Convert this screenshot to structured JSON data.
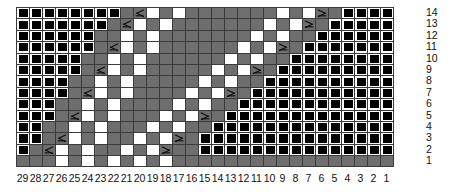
{
  "chart_title": "Lace Knitting Chart",
  "legend_keys": {
    "black_square": "no-stitch / cast-off",
    "gray_cell": "knit",
    "white_cell": "purl or yarn-over",
    "dec_left": "left-leaning decrease",
    "dec_right": "right-leaning decrease"
  },
  "colors": {
    "gray": "#6e6e6e",
    "white": "#ffffff",
    "black": "#000000",
    "gridline": "#3a3a3a",
    "heavy_gridline": "#111111",
    "text": "#111111"
  },
  "grid": {
    "columns": 29,
    "rows": 14,
    "cell_width_px": 13,
    "cell_height_px": 11.4
  },
  "row_numbers": [
    "14",
    "13",
    "12",
    "11",
    "10",
    "9",
    "8",
    "7",
    "6",
    "5",
    "4",
    "3",
    "2",
    "1"
  ],
  "column_numbers": [
    "29",
    "28",
    "27",
    "26",
    "25",
    "24",
    "23",
    "22",
    "21",
    "20",
    "19",
    "18",
    "17",
    "16",
    "15",
    "14",
    "13",
    "12",
    "11",
    "10",
    "9",
    "8",
    "7",
    "6",
    "5",
    "4",
    "3",
    "2",
    "1"
  ],
  "heavy_column_rules_after": [
    4,
    9,
    14,
    19,
    24
  ],
  "chart_data": {
    "type": "heatmap",
    "xlabel": "",
    "ylabel": "",
    "x": [
      "29",
      "28",
      "27",
      "26",
      "25",
      "24",
      "23",
      "22",
      "21",
      "20",
      "19",
      "18",
      "17",
      "16",
      "15",
      "14",
      "13",
      "12",
      "11",
      "10",
      "9",
      "8",
      "7",
      "6",
      "5",
      "4",
      "3",
      "2",
      "1"
    ],
    "y": [
      "14",
      "13",
      "12",
      "11",
      "10",
      "9",
      "8",
      "7",
      "6",
      "5",
      "4",
      "3",
      "2",
      "1"
    ],
    "legend": [
      "no-stitch",
      "knit",
      "purl/yo",
      "left decrease",
      "right decrease"
    ],
    "cell_codes": {
      "b": "no-stitch (black square)",
      "g": "knit (gray)",
      "w": "purl / yarn-over (white)",
      "L": "left-leaning decrease",
      "R": "right-leaning decrease"
    },
    "rows": [
      {
        "row": "14",
        "cells": [
          "b",
          "b",
          "b",
          "b",
          "b",
          "b",
          "b",
          "b",
          "g",
          "L",
          "w",
          "g",
          "w",
          "g",
          "g",
          "g",
          "g",
          "g",
          "g",
          "g",
          "w",
          "g",
          "w",
          "R",
          "g",
          "b",
          "b",
          "b",
          "b"
        ]
      },
      {
        "row": "13",
        "cells": [
          "b",
          "b",
          "b",
          "b",
          "b",
          "b",
          "b",
          "g",
          "L",
          "w",
          "g",
          "w",
          "g",
          "g",
          "g",
          "g",
          "g",
          "g",
          "g",
          "w",
          "g",
          "w",
          "R",
          "g",
          "b",
          "b",
          "b",
          "b",
          "b"
        ]
      },
      {
        "row": "12",
        "cells": [
          "b",
          "b",
          "b",
          "b",
          "b",
          "b",
          "g",
          "g",
          "w",
          "g",
          "w",
          "g",
          "g",
          "g",
          "g",
          "g",
          "g",
          "g",
          "w",
          "g",
          "w",
          "g",
          "g",
          "b",
          "b",
          "b",
          "b",
          "b",
          "b"
        ]
      },
      {
        "row": "11",
        "cells": [
          "b",
          "b",
          "b",
          "b",
          "b",
          "b",
          "g",
          "L",
          "w",
          "g",
          "w",
          "g",
          "g",
          "g",
          "g",
          "g",
          "g",
          "w",
          "g",
          "w",
          "R",
          "g",
          "b",
          "b",
          "b",
          "b",
          "b",
          "b",
          "b"
        ]
      },
      {
        "row": "10",
        "cells": [
          "b",
          "b",
          "b",
          "b",
          "b",
          "g",
          "g",
          "w",
          "g",
          "w",
          "g",
          "g",
          "g",
          "g",
          "g",
          "g",
          "w",
          "g",
          "w",
          "g",
          "g",
          "b",
          "b",
          "b",
          "b",
          "b",
          "b",
          "b",
          "b"
        ]
      },
      {
        "row": "9",
        "cells": [
          "b",
          "b",
          "b",
          "b",
          "b",
          "g",
          "L",
          "w",
          "g",
          "w",
          "g",
          "g",
          "g",
          "g",
          "g",
          "w",
          "g",
          "w",
          "R",
          "g",
          "b",
          "b",
          "b",
          "b",
          "b",
          "b",
          "b",
          "b",
          "b"
        ]
      },
      {
        "row": "8",
        "cells": [
          "b",
          "b",
          "b",
          "b",
          "g",
          "g",
          "w",
          "g",
          "w",
          "g",
          "g",
          "g",
          "g",
          "g",
          "w",
          "g",
          "w",
          "g",
          "g",
          "b",
          "b",
          "b",
          "b",
          "b",
          "b",
          "b",
          "b",
          "b",
          "b"
        ]
      },
      {
        "row": "7",
        "cells": [
          "b",
          "b",
          "b",
          "b",
          "g",
          "L",
          "w",
          "g",
          "w",
          "g",
          "g",
          "g",
          "g",
          "w",
          "g",
          "w",
          "R",
          "g",
          "b",
          "b",
          "b",
          "b",
          "b",
          "b",
          "b",
          "b",
          "b",
          "b",
          "b"
        ]
      },
      {
        "row": "6",
        "cells": [
          "b",
          "b",
          "b",
          "g",
          "g",
          "w",
          "g",
          "w",
          "g",
          "g",
          "g",
          "g",
          "w",
          "g",
          "w",
          "g",
          "g",
          "b",
          "b",
          "b",
          "b",
          "b",
          "b",
          "b",
          "b",
          "b",
          "b",
          "b",
          "b"
        ]
      },
      {
        "row": "5",
        "cells": [
          "b",
          "b",
          "b",
          "g",
          "L",
          "w",
          "g",
          "w",
          "g",
          "g",
          "g",
          "w",
          "g",
          "w",
          "R",
          "g",
          "b",
          "b",
          "b",
          "b",
          "b",
          "b",
          "b",
          "b",
          "b",
          "b",
          "b",
          "b",
          "b"
        ]
      },
      {
        "row": "4",
        "cells": [
          "b",
          "b",
          "g",
          "g",
          "w",
          "g",
          "w",
          "g",
          "g",
          "g",
          "w",
          "g",
          "w",
          "g",
          "g",
          "b",
          "b",
          "b",
          "b",
          "b",
          "b",
          "b",
          "b",
          "b",
          "b",
          "b",
          "b",
          "b",
          "b"
        ]
      },
      {
        "row": "3",
        "cells": [
          "b",
          "b",
          "g",
          "L",
          "w",
          "g",
          "w",
          "g",
          "g",
          "w",
          "g",
          "w",
          "R",
          "g",
          "b",
          "b",
          "b",
          "b",
          "b",
          "b",
          "b",
          "b",
          "b",
          "b",
          "b",
          "b",
          "b",
          "b",
          "b"
        ]
      },
      {
        "row": "2",
        "cells": [
          "b",
          "g",
          "L",
          "w",
          "g",
          "w",
          "g",
          "g",
          "w",
          "g",
          "w",
          "R",
          "g",
          "g",
          "b",
          "b",
          "b",
          "b",
          "b",
          "b",
          "b",
          "b",
          "b",
          "b",
          "b",
          "b",
          "b",
          "b",
          "b"
        ]
      },
      {
        "row": "1",
        "cells": [
          "g",
          "g",
          "g",
          "w",
          "g",
          "w",
          "g",
          "w",
          "g",
          "w",
          "g",
          "w",
          "g",
          "g",
          "g",
          "g",
          "g",
          "g",
          "g",
          "g",
          "g",
          "g",
          "g",
          "g",
          "g",
          "g",
          "g",
          "g",
          "g"
        ]
      }
    ]
  }
}
